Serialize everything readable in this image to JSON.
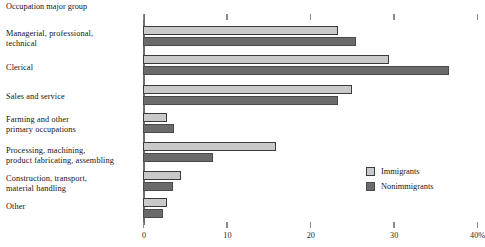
{
  "chart_data": {
    "type": "bar",
    "orientation": "horizontal",
    "title": "",
    "axis_title": "Occupation major group",
    "xlabel": "",
    "ylabel": "",
    "xlim": [
      0,
      40
    ],
    "grid": false,
    "legend_position": "right",
    "categories": [
      "Managerial, professional,\ntechnical",
      "Clerical",
      "Sales and service",
      "Farming and other\nprimary occupations",
      "Processing, machining,\nproduct fabricating, assembling",
      "Construction, transport,\nmaterial handling",
      "Other"
    ],
    "tick_labels": [
      "0",
      "10",
      "20",
      "30",
      "40%"
    ],
    "tick_values": [
      0,
      10,
      20,
      30,
      40
    ],
    "series": [
      {
        "name": "Immigrants",
        "color": "#c9c9c9",
        "values": [
          23.4,
          29.5,
          25.0,
          2.9,
          16.0,
          4.6,
          2.9
        ]
      },
      {
        "name": "Nonimmigrants",
        "color": "#6b6b6b",
        "values": [
          25.5,
          36.7,
          23.4,
          3.7,
          8.4,
          3.6,
          2.4
        ]
      }
    ]
  },
  "legend": {
    "items": [
      {
        "label": "Immigrants",
        "color": "#c9c9c9"
      },
      {
        "label": "Nonimmigrants",
        "color": "#6b6b6b"
      }
    ]
  }
}
